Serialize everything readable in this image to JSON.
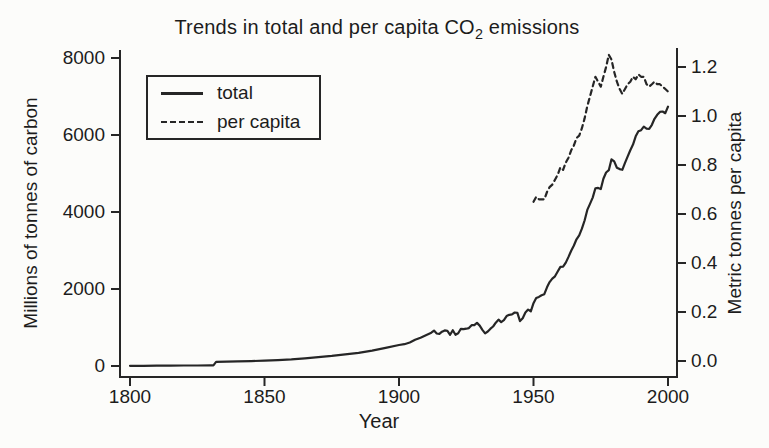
{
  "chart_data": {
    "type": "line",
    "title": "Trends in total and per capita CO2 emissions",
    "title_parts": {
      "prefix": "Trends in total and per capita CO",
      "subscript": "2",
      "suffix": " emissions"
    },
    "xlabel": "Year",
    "ylabel_left": "Millions of tonnes of carbon",
    "ylabel_right": "Metric tonnes per capita",
    "x_range": [
      1800,
      2000
    ],
    "yleft_range": [
      0,
      8000
    ],
    "yright_range": [
      0.0,
      1.2
    ],
    "x_ticks": [
      1800,
      1850,
      1900,
      1950,
      2000
    ],
    "yleft_ticks": [
      0,
      2000,
      4000,
      6000,
      8000
    ],
    "yright_ticks": [
      0.0,
      0.2,
      0.4,
      0.6,
      0.8,
      1.0,
      1.2
    ],
    "grid": false,
    "legend": {
      "position": "upper-left-inside",
      "entries": [
        {
          "label": "total",
          "style": "solid"
        },
        {
          "label": "per capita",
          "style": "dashed"
        }
      ]
    },
    "colors": {
      "line": "#262626",
      "text": "#1c1c1c",
      "background": "#fcfcfa"
    },
    "series": [
      {
        "name": "total",
        "axis": "left",
        "style": "solid",
        "units": "millions of tonnes of carbon",
        "points": [
          [
            1800,
            5
          ],
          [
            1805,
            6
          ],
          [
            1810,
            8
          ],
          [
            1815,
            10
          ],
          [
            1820,
            12
          ],
          [
            1825,
            14
          ],
          [
            1830,
            16
          ],
          [
            1831,
            16
          ],
          [
            1832,
            110
          ],
          [
            1836,
            115
          ],
          [
            1840,
            122
          ],
          [
            1845,
            128
          ],
          [
            1850,
            138
          ],
          [
            1855,
            152
          ],
          [
            1860,
            172
          ],
          [
            1865,
            200
          ],
          [
            1870,
            232
          ],
          [
            1875,
            262
          ],
          [
            1880,
            300
          ],
          [
            1885,
            342
          ],
          [
            1890,
            400
          ],
          [
            1895,
            470
          ],
          [
            1900,
            545
          ],
          [
            1902,
            565
          ],
          [
            1904,
            610
          ],
          [
            1906,
            680
          ],
          [
            1908,
            735
          ],
          [
            1910,
            800
          ],
          [
            1912,
            865
          ],
          [
            1913,
            920
          ],
          [
            1914,
            845
          ],
          [
            1915,
            835
          ],
          [
            1916,
            890
          ],
          [
            1917,
            925
          ],
          [
            1918,
            915
          ],
          [
            1919,
            810
          ],
          [
            1920,
            930
          ],
          [
            1921,
            810
          ],
          [
            1922,
            850
          ],
          [
            1923,
            965
          ],
          [
            1924,
            955
          ],
          [
            1925,
            970
          ],
          [
            1926,
            985
          ],
          [
            1927,
            1060
          ],
          [
            1928,
            1060
          ],
          [
            1929,
            1120
          ],
          [
            1930,
            1050
          ],
          [
            1931,
            940
          ],
          [
            1932,
            850
          ],
          [
            1933,
            895
          ],
          [
            1934,
            970
          ],
          [
            1935,
            1025
          ],
          [
            1936,
            1125
          ],
          [
            1937,
            1205
          ],
          [
            1938,
            1140
          ],
          [
            1939,
            1190
          ],
          [
            1940,
            1295
          ],
          [
            1941,
            1330
          ],
          [
            1942,
            1340
          ],
          [
            1943,
            1390
          ],
          [
            1944,
            1380
          ],
          [
            1945,
            1165
          ],
          [
            1946,
            1240
          ],
          [
            1947,
            1390
          ],
          [
            1948,
            1465
          ],
          [
            1949,
            1420
          ],
          [
            1950,
            1630
          ],
          [
            1951,
            1765
          ],
          [
            1952,
            1795
          ],
          [
            1953,
            1840
          ],
          [
            1954,
            1865
          ],
          [
            1955,
            2045
          ],
          [
            1956,
            2180
          ],
          [
            1957,
            2270
          ],
          [
            1958,
            2330
          ],
          [
            1959,
            2455
          ],
          [
            1960,
            2575
          ],
          [
            1961,
            2580
          ],
          [
            1962,
            2685
          ],
          [
            1963,
            2835
          ],
          [
            1964,
            2995
          ],
          [
            1965,
            3130
          ],
          [
            1966,
            3290
          ],
          [
            1967,
            3395
          ],
          [
            1968,
            3565
          ],
          [
            1969,
            3780
          ],
          [
            1970,
            4055
          ],
          [
            1971,
            4210
          ],
          [
            1972,
            4375
          ],
          [
            1973,
            4615
          ],
          [
            1974,
            4625
          ],
          [
            1975,
            4595
          ],
          [
            1976,
            4865
          ],
          [
            1977,
            5025
          ],
          [
            1978,
            5085
          ],
          [
            1979,
            5370
          ],
          [
            1980,
            5315
          ],
          [
            1981,
            5150
          ],
          [
            1982,
            5115
          ],
          [
            1983,
            5095
          ],
          [
            1984,
            5275
          ],
          [
            1985,
            5440
          ],
          [
            1986,
            5605
          ],
          [
            1987,
            5750
          ],
          [
            1988,
            5965
          ],
          [
            1989,
            6095
          ],
          [
            1990,
            6125
          ],
          [
            1991,
            6215
          ],
          [
            1992,
            6165
          ],
          [
            1993,
            6160
          ],
          [
            1994,
            6265
          ],
          [
            1995,
            6420
          ],
          [
            1996,
            6525
          ],
          [
            1997,
            6600
          ],
          [
            1998,
            6610
          ],
          [
            1999,
            6565
          ],
          [
            2000,
            6735
          ]
        ]
      },
      {
        "name": "per capita",
        "axis": "right",
        "style": "dashed",
        "units": "metric tonnes per capita",
        "points": [
          [
            1950,
            0.65
          ],
          [
            1951,
            0.67
          ],
          [
            1952,
            0.66
          ],
          [
            1953,
            0.66
          ],
          [
            1954,
            0.66
          ],
          [
            1955,
            0.69
          ],
          [
            1956,
            0.71
          ],
          [
            1957,
            0.72
          ],
          [
            1958,
            0.74
          ],
          [
            1959,
            0.76
          ],
          [
            1960,
            0.79
          ],
          [
            1961,
            0.78
          ],
          [
            1962,
            0.81
          ],
          [
            1963,
            0.83
          ],
          [
            1964,
            0.86
          ],
          [
            1965,
            0.88
          ],
          [
            1966,
            0.91
          ],
          [
            1967,
            0.92
          ],
          [
            1968,
            0.95
          ],
          [
            1969,
            0.99
          ],
          [
            1970,
            1.04
          ],
          [
            1971,
            1.08
          ],
          [
            1972,
            1.12
          ],
          [
            1973,
            1.16
          ],
          [
            1974,
            1.14
          ],
          [
            1975,
            1.12
          ],
          [
            1976,
            1.16
          ],
          [
            1977,
            1.2
          ],
          [
            1978,
            1.25
          ],
          [
            1979,
            1.23
          ],
          [
            1980,
            1.18
          ],
          [
            1981,
            1.14
          ],
          [
            1982,
            1.11
          ],
          [
            1983,
            1.09
          ],
          [
            1984,
            1.11
          ],
          [
            1985,
            1.13
          ],
          [
            1986,
            1.14
          ],
          [
            1987,
            1.16
          ],
          [
            1988,
            1.15
          ],
          [
            1989,
            1.17
          ],
          [
            1990,
            1.16
          ],
          [
            1991,
            1.16
          ],
          [
            1992,
            1.13
          ],
          [
            1993,
            1.12
          ],
          [
            1994,
            1.13
          ],
          [
            1995,
            1.14
          ],
          [
            1996,
            1.13
          ],
          [
            1997,
            1.13
          ],
          [
            1998,
            1.12
          ],
          [
            1999,
            1.11
          ],
          [
            2000,
            1.1
          ]
        ]
      }
    ]
  }
}
